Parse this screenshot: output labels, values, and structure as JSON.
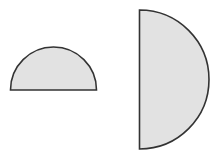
{
  "diagram": {
    "shapes": [
      {
        "type": "semicircle",
        "orientation": "flat-bottom",
        "center": [
          53.5,
          90
        ],
        "radius": 43,
        "fill": "#e2e2e2",
        "stroke": "#333333"
      },
      {
        "type": "semicircle",
        "orientation": "flat-left",
        "center": [
          139.5,
          79.5
        ],
        "radius": 69.5,
        "fill": "#e2e2e2",
        "stroke": "#333333"
      }
    ]
  },
  "colors": {
    "background": "#ffffff",
    "fill": "#e2e2e2",
    "stroke": "#333333"
  }
}
